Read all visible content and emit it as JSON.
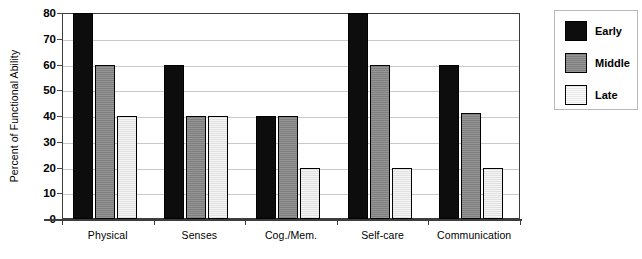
{
  "chart_data": {
    "type": "bar",
    "title": "",
    "subtitle": "",
    "xlabel": "",
    "ylabel": "Percent of Functional Ability",
    "ylim": [
      0,
      80
    ],
    "ytick_interval": 10,
    "yticks": [
      0,
      10,
      20,
      30,
      40,
      50,
      60,
      70,
      80
    ],
    "ytick_labels": [
      "0",
      "10",
      "20",
      "30",
      "40",
      "50",
      "60",
      "70",
      "80"
    ],
    "grid": true,
    "grid_axis": "y",
    "legend_position": "right-outside",
    "categories": [
      "Physical",
      "Senses",
      "Cog./Mem.",
      "Self-care",
      "Communication"
    ],
    "series": [
      {
        "name": "Early",
        "color": "#0d0d0d",
        "values": [
          80,
          60,
          40,
          80,
          60
        ]
      },
      {
        "name": "Middle",
        "color": "#8d8d8d",
        "values": [
          60,
          40,
          40,
          60,
          41
        ]
      },
      {
        "name": "Late",
        "color": "#e9e9e9",
        "values": [
          40,
          40,
          20,
          20,
          20
        ]
      }
    ],
    "annotations": []
  },
  "colors": {
    "early": "#0d0d0d",
    "middle": "#8d8d8d",
    "late": "#e9e9e9",
    "axis": "#3d3d3d",
    "gridline": "#c9c9c9",
    "legend_border": "#b9b9b9",
    "background": "#ffffff"
  }
}
